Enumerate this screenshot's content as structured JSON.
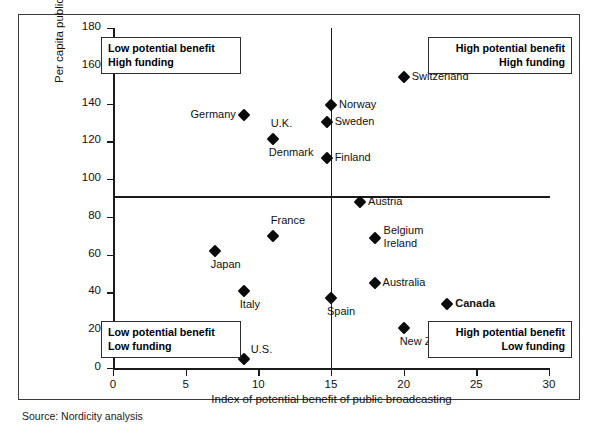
{
  "chart_data": {
    "type": "scatter",
    "title": "",
    "xlabel": "Index of potential benefit of public broadcasting",
    "ylabel": "Per capita public funding",
    "xlim": [
      0,
      30
    ],
    "ylim": [
      0,
      180
    ],
    "xticks": [
      0,
      5,
      10,
      15,
      20,
      25,
      30
    ],
    "yticks": [
      0,
      20,
      40,
      60,
      80,
      100,
      120,
      140,
      160,
      180
    ],
    "grid": false,
    "legend": "none",
    "quadrant_divider_x": 15,
    "quadrant_divider_y": 91,
    "points": [
      {
        "label": "Germany",
        "x": 9,
        "y": 134,
        "label_side": "left",
        "bold": false
      },
      {
        "label": "U.K.",
        "x": 11,
        "y": 121,
        "label_side": "above",
        "bold": false
      },
      {
        "label": "Denmark",
        "x": 11,
        "y": 121,
        "label_side": "below",
        "bold": false
      },
      {
        "label": "Norway",
        "x": 15,
        "y": 139,
        "label_side": "right",
        "bold": false
      },
      {
        "label": "Sweden",
        "x": 14.7,
        "y": 130,
        "label_side": "right",
        "bold": false
      },
      {
        "label": "Finland",
        "x": 14.7,
        "y": 111,
        "label_side": "right",
        "bold": false
      },
      {
        "label": "Switzerland",
        "x": 20,
        "y": 154,
        "label_side": "right",
        "bold": false
      },
      {
        "label": "Austria",
        "x": 17,
        "y": 88,
        "label_side": "right",
        "bold": false
      },
      {
        "label": "Belgium",
        "x": 18,
        "y": 69,
        "label_side": "right-upper",
        "bold": false
      },
      {
        "label": "Ireland",
        "x": 18,
        "y": 69,
        "label_side": "right-lower",
        "bold": false
      },
      {
        "label": "France",
        "x": 11,
        "y": 70,
        "label_side": "above",
        "bold": false
      },
      {
        "label": "Japan",
        "x": 7,
        "y": 62,
        "label_side": "below",
        "bold": false
      },
      {
        "label": "Italy",
        "x": 9,
        "y": 41,
        "label_side": "below",
        "bold": false
      },
      {
        "label": "Australia",
        "x": 18,
        "y": 45,
        "label_side": "right",
        "bold": false
      },
      {
        "label": "Spain",
        "x": 15,
        "y": 37,
        "label_side": "below",
        "bold": false
      },
      {
        "label": "Canada",
        "x": 23,
        "y": 34,
        "label_side": "right",
        "bold": true
      },
      {
        "label": "New Zealand",
        "x": 20,
        "y": 21,
        "label_side": "below",
        "bold": false
      },
      {
        "label": "U.S.",
        "x": 9,
        "y": 5,
        "label_side": "above-right",
        "bold": false
      }
    ]
  },
  "annotations": {
    "top_left": {
      "line1": "Low potential benefit",
      "line2": "High funding"
    },
    "top_right": {
      "line1": "High potential benefit",
      "line2": "High funding"
    },
    "bottom_left": {
      "line1": "Low potential benefit",
      "line2": "Low funding"
    },
    "bottom_right": {
      "line1": "High potential benefit",
      "line2": "Low funding"
    }
  },
  "source": {
    "text": "Source: Nordicity analysis"
  },
  "axis": {
    "x_title": "Index of potential benefit of public broadcasting",
    "y_title": "Per capita public funding"
  }
}
